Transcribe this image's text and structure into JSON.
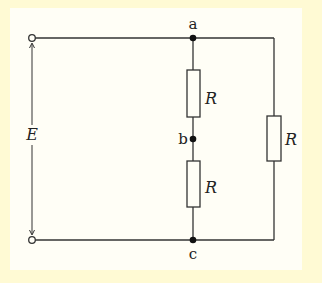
{
  "diagram": {
    "type": "circuit",
    "colors": {
      "background": "#fffad4",
      "panel": "#fffef6",
      "wire": "#333333"
    },
    "source": {
      "label": "E"
    },
    "nodes": [
      {
        "id": "a",
        "label": "a"
      },
      {
        "id": "b",
        "label": "b"
      },
      {
        "id": "c",
        "label": "c"
      }
    ],
    "resistors": [
      {
        "id": "r_ab",
        "label": "R",
        "between": [
          "a",
          "b"
        ]
      },
      {
        "id": "r_bc",
        "label": "R",
        "between": [
          "b",
          "c"
        ]
      },
      {
        "id": "r_ac",
        "label": "R",
        "between": [
          "a",
          "c"
        ]
      }
    ]
  }
}
